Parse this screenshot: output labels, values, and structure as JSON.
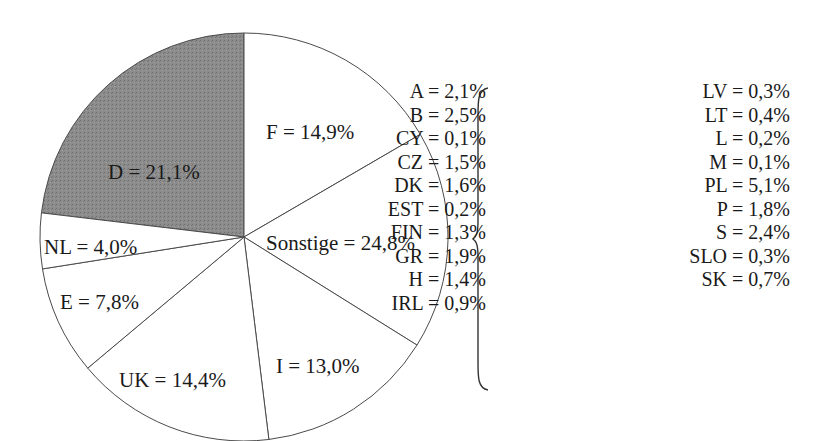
{
  "chart_data": {
    "type": "pie",
    "title": "",
    "center_px": [
      244,
      237
    ],
    "radius_px": 204,
    "slices": [
      {
        "label": "D",
        "text": "D = 21,1%",
        "value": 21.1,
        "fill": "#8a8a8a",
        "start_deg": 276.8,
        "end_deg": 360,
        "label_pos": [
          108,
          162
        ]
      },
      {
        "label": "F",
        "text": "F = 14,9%",
        "value": 14.9,
        "fill": "#ffffff",
        "start_deg": 0,
        "end_deg": 59.8,
        "label_pos": [
          266,
          122
        ]
      },
      {
        "label": "Sonstige",
        "text": "Sonstige = 24,8%",
        "value": 24.8,
        "fill": "#ffffff",
        "start_deg": 59.8,
        "end_deg": 122,
        "label_pos": [
          266,
          233
        ]
      },
      {
        "label": "I",
        "text": "I = 13,0%",
        "value": 13.0,
        "fill": "#ffffff",
        "start_deg": 122,
        "end_deg": 173,
        "label_pos": [
          276,
          356
        ]
      },
      {
        "label": "UK",
        "text": "UK = 14,4%",
        "value": 14.4,
        "fill": "#ffffff",
        "start_deg": 173,
        "end_deg": 230,
        "label_pos": [
          119,
          370
        ]
      },
      {
        "label": "E",
        "text": "E = 7,8%",
        "value": 7.8,
        "fill": "#ffffff",
        "start_deg": 230,
        "end_deg": 261,
        "label_pos": [
          60,
          292
        ]
      },
      {
        "label": "NL",
        "text": "NL = 4,0%",
        "value": 4.0,
        "fill": "#ffffff",
        "start_deg": 261,
        "end_deg": 276.8,
        "label_pos": [
          44,
          237
        ]
      }
    ],
    "legend_note": "Breakdown of 'Sonstige'",
    "legend": [
      [
        {
          "label": "A",
          "value": 2.1,
          "text": "A = 2,1%"
        },
        {
          "label": "B",
          "value": 2.5,
          "text": "B = 2,5%"
        },
        {
          "label": "CY",
          "value": 0.1,
          "text": "CY = 0,1%"
        },
        {
          "label": "CZ",
          "value": 1.5,
          "text": "CZ = 1,5%"
        },
        {
          "label": "DK",
          "value": 1.6,
          "text": "DK = 1,6%"
        },
        {
          "label": "EST",
          "value": 0.2,
          "text": "EST = 0,2%"
        },
        {
          "label": "FIN",
          "value": 1.3,
          "text": "FIN = 1,3%"
        },
        {
          "label": "GR",
          "value": 1.9,
          "text": "GR = 1,9%"
        },
        {
          "label": "H",
          "value": 1.4,
          "text": "H = 1,4%"
        },
        {
          "label": "IRL",
          "value": 0.9,
          "text": "IRL = 0,9%"
        }
      ],
      [
        {
          "label": "LV",
          "value": 0.3,
          "text": "LV = 0,3%"
        },
        {
          "label": "LT",
          "value": 0.4,
          "text": "LT = 0,4%"
        },
        {
          "label": "L",
          "value": 0.2,
          "text": "L = 0,2%"
        },
        {
          "label": "M",
          "value": 0.1,
          "text": "M = 0,1%"
        },
        {
          "label": "PL",
          "value": 5.1,
          "text": "PL = 5,1%"
        },
        {
          "label": "P",
          "value": 1.8,
          "text": "P = 1,8%"
        },
        {
          "label": "S",
          "value": 2.4,
          "text": "S = 2,4%"
        },
        {
          "label": "SLO",
          "value": 0.3,
          "text": "SLO = 0,3%"
        },
        {
          "label": "SK",
          "value": 0.7,
          "text": "SK = 0,7%"
        }
      ]
    ]
  }
}
